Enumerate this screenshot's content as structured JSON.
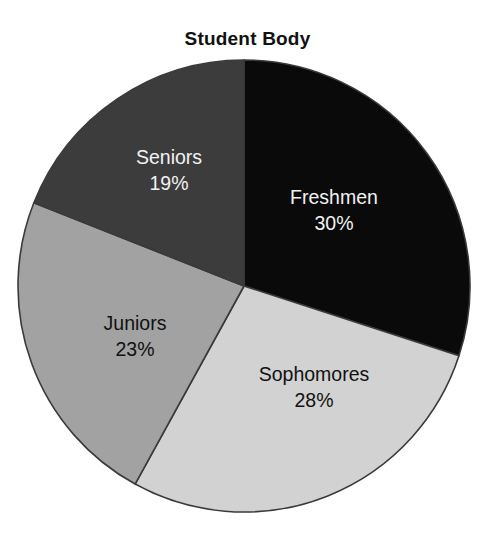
{
  "chart_data": {
    "type": "pie",
    "title": "Student Body",
    "xlabel": "",
    "ylabel": "",
    "legend": "none",
    "grid": false,
    "units": "percent",
    "start_angle_deg": 0,
    "direction": "clockwise",
    "categories": [
      "Freshmen",
      "Sophomores",
      "Juniors",
      "Seniors"
    ],
    "values": [
      30,
      28,
      23,
      19
    ],
    "total": 100,
    "slices": [
      {
        "label": "Freshmen",
        "value": 30,
        "value_text": "30%",
        "color": "#0a0a0a",
        "text_color": "#f2f2f2",
        "angle_deg": 108,
        "label_x": 334,
        "label_y": 204
      },
      {
        "label": "Sophomores",
        "value": 28,
        "value_text": "28%",
        "color": "#d2d2d2",
        "text_color": "#111111",
        "angle_deg": 100.8,
        "label_x": 314,
        "label_y": 381
      },
      {
        "label": "Juniors",
        "value": 23,
        "value_text": "23%",
        "color": "#a2a2a2",
        "text_color": "#111111",
        "angle_deg": 82.8,
        "label_x": 135,
        "label_y": 330
      },
      {
        "label": "Seniors",
        "value": 19,
        "value_text": "19%",
        "color": "#3c3c3c",
        "text_color": "#f2f2f2",
        "angle_deg": 68.4,
        "label_x": 169,
        "label_y": 164
      }
    ]
  },
  "geometry": {
    "center_x": 244,
    "center_y": 286,
    "radius": 226,
    "stroke_color": "#3a3a3a",
    "stroke_width": 1.6
  }
}
